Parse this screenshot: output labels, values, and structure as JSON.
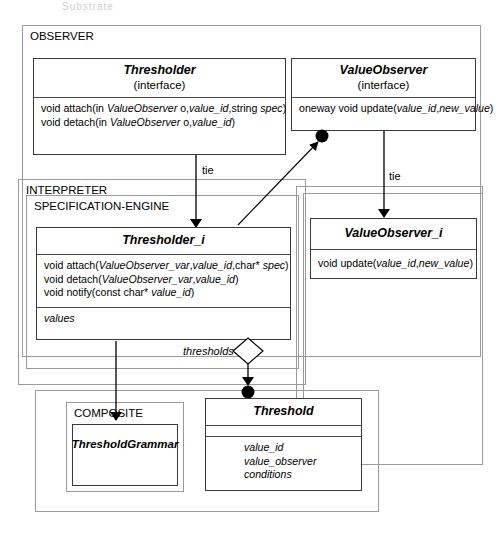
{
  "diagram": {
    "type": "uml-class-diagram",
    "ghost_header": "Substrate",
    "frames": [
      {
        "id": "observer",
        "label": "OBSERVER"
      },
      {
        "id": "interpreter",
        "label": "INTERPRETER"
      },
      {
        "id": "specengine",
        "label": "SPECIFICATION-ENGINE"
      },
      {
        "id": "composite",
        "label": "COMPOSITE"
      }
    ],
    "classes": [
      {
        "id": "thresholder",
        "name": "Thresholder",
        "stereotype": "(interface)",
        "operations": [
          "void attach(in ValueObserver o,value_id,string spec)",
          "void detach(in ValueObserver o,value_id)"
        ],
        "attributes": []
      },
      {
        "id": "valueobserver",
        "name": "ValueObserver",
        "stereotype": "(interface)",
        "operations": [
          "oneway void update(value_id,new_value)"
        ],
        "attributes": []
      },
      {
        "id": "thresholder_i",
        "name": "Thresholder_i",
        "stereotype": "",
        "operations": [
          "void attach(ValueObserver_var,value_id,char* spec)",
          "void detach(ValueObserver_var,value_id)",
          "void notify(const char* value_id)"
        ],
        "attributes": [
          "values"
        ]
      },
      {
        "id": "valueobserver_i",
        "name": "ValueObserver_i",
        "stereotype": "",
        "operations": [
          "void update(value_id,new_value)"
        ],
        "attributes": []
      },
      {
        "id": "thresholdgrammar",
        "name": "ThresholdGrammar",
        "stereotype": "",
        "operations": [],
        "attributes": []
      },
      {
        "id": "threshold",
        "name": "Threshold",
        "stereotype": "",
        "operations": [],
        "attributes": [
          "value_id",
          "value_observer",
          "conditions"
        ]
      }
    ],
    "edge_labels": {
      "tie_left": "tie",
      "tie_right": "tie",
      "thresholds": "thresholds"
    },
    "colors": {
      "line": "#3a3a3a",
      "frame_line": "#9a9a9a",
      "background": "#ffffff",
      "text": "#000000"
    }
  }
}
